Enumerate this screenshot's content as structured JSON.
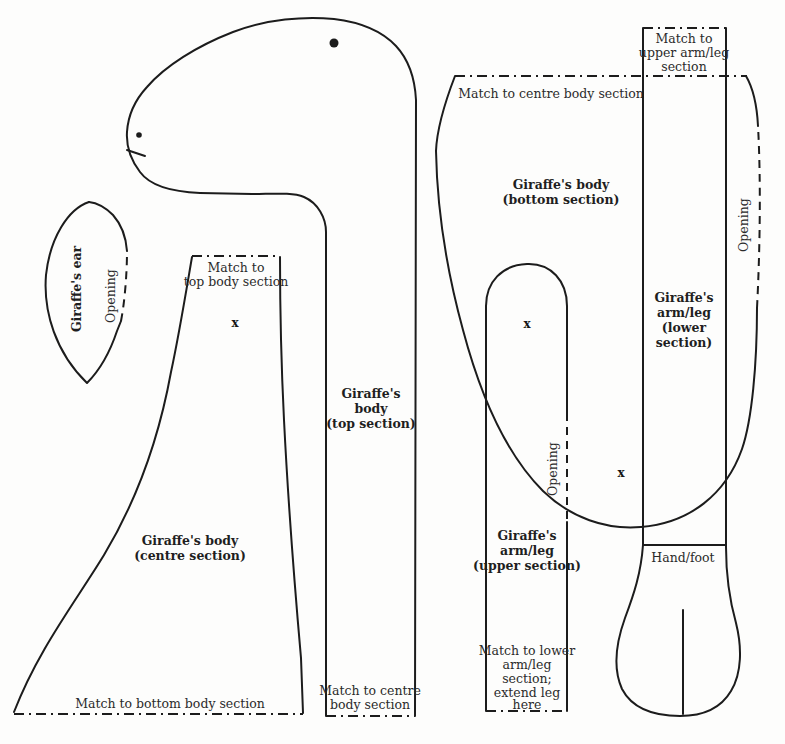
{
  "figure_title": "Giraffe sewing pattern pieces",
  "colors": {
    "line": "#1c1c1c",
    "text": "#2b2b2b",
    "background": "#fdfdfc"
  },
  "marks": {
    "cross": "x"
  },
  "pieces": {
    "ear": {
      "label": "Giraffe's ear",
      "opening_label": "Opening"
    },
    "body_top": {
      "label_lines": [
        "Giraffe's",
        "body",
        "(top section)"
      ],
      "match_bottom_lines": [
        "Match to centre",
        "body section"
      ]
    },
    "body_centre": {
      "label_lines": [
        "Giraffe's body",
        "(centre section)"
      ],
      "match_top_lines": [
        "Match to",
        "top body section"
      ],
      "match_bottom": "Match to bottom body section"
    },
    "body_bottom": {
      "label_lines": [
        "Giraffe's body",
        "(bottom section)"
      ],
      "match_top": "Match to centre body section"
    },
    "arm_leg_upper": {
      "label_lines": [
        "Giraffe's",
        "arm/leg",
        "(upper section)"
      ],
      "opening_label": "Opening",
      "match_bottom_lines": [
        "Match to lower",
        "arm/leg",
        "section;",
        "extend leg",
        "here"
      ]
    },
    "arm_leg_lower": {
      "label_lines": [
        "Giraffe's",
        "arm/leg",
        "(lower",
        "section)"
      ],
      "match_top_lines": [
        "Match to",
        "upper arm/leg",
        "section"
      ],
      "opening_label": "Opening",
      "hand_foot_label": "Hand/foot"
    }
  }
}
